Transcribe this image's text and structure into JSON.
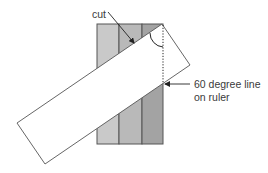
{
  "diagram": {
    "labels": {
      "cut": "cut",
      "ruler_line_1": "60 degree line",
      "ruler_line_2": "on ruler"
    },
    "fabric": {
      "stripes": [
        {
          "name": "stripe-1",
          "color": "#c9c9c9"
        },
        {
          "name": "stripe-2",
          "color": "#b9b9b9"
        },
        {
          "name": "stripe-3",
          "color": "#a3a3a3"
        }
      ],
      "border_color": "#555555"
    },
    "ruler": {
      "fill": "#ffffff",
      "stroke": "#555555"
    },
    "annotations": {
      "angle_arc": "angle-marker",
      "guide_line": "dotted vertical alignment line"
    }
  }
}
